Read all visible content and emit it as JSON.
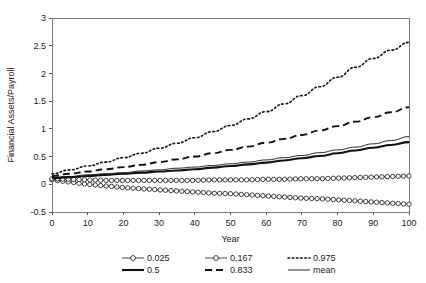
{
  "chart_data": {
    "type": "line",
    "title": "",
    "xlabel": "Year",
    "ylabel": "Financial Assets/Payroll",
    "xlim": [
      0,
      100
    ],
    "ylim": [
      -0.5,
      3
    ],
    "xticks": [
      0,
      10,
      20,
      30,
      40,
      50,
      60,
      70,
      80,
      90,
      100
    ],
    "yticks": [
      -0.5,
      0,
      0.5,
      1,
      1.5,
      2,
      2.5,
      3
    ],
    "xtick_labels": [
      "0",
      "10",
      "20",
      "30",
      "40",
      "50",
      "60",
      "70",
      "80",
      "90",
      "100"
    ],
    "ytick_labels": [
      "-0.5",
      "0",
      "0.5",
      "1",
      "1.5",
      "2",
      "2.5",
      "3"
    ],
    "grid": false,
    "legend_position": "bottom",
    "x": [
      0,
      5,
      10,
      15,
      20,
      25,
      30,
      35,
      40,
      45,
      50,
      55,
      60,
      65,
      70,
      75,
      80,
      85,
      90,
      95,
      100
    ],
    "series": [
      {
        "name": "0.025",
        "label": "0.025",
        "style": "line-open-circle-markers",
        "color": "#111111",
        "values": [
          0.08,
          0.04,
          0.0,
          -0.03,
          -0.06,
          -0.08,
          -0.1,
          -0.12,
          -0.14,
          -0.16,
          -0.17,
          -0.19,
          -0.21,
          -0.23,
          -0.25,
          -0.26,
          -0.28,
          -0.3,
          -0.32,
          -0.34,
          -0.36
        ]
      },
      {
        "name": "0.167",
        "label": "0.167",
        "style": "line-open-circle-markers",
        "color": "#111111",
        "values": [
          0.1,
          0.09,
          0.08,
          0.07,
          0.07,
          0.07,
          0.07,
          0.07,
          0.07,
          0.08,
          0.08,
          0.08,
          0.09,
          0.09,
          0.1,
          0.1,
          0.11,
          0.12,
          0.13,
          0.14,
          0.15
        ]
      },
      {
        "name": "0.975",
        "label": "0.975",
        "style": "dotted",
        "color": "#111111",
        "values": [
          0.19,
          0.26,
          0.33,
          0.4,
          0.48,
          0.56,
          0.65,
          0.74,
          0.84,
          0.95,
          1.06,
          1.18,
          1.31,
          1.45,
          1.6,
          1.76,
          1.93,
          2.11,
          2.27,
          2.42,
          2.56
        ]
      },
      {
        "name": "0.5",
        "label": "0.5",
        "style": "solid-thick",
        "color": "#111111",
        "values": [
          0.11,
          0.13,
          0.15,
          0.17,
          0.19,
          0.21,
          0.23,
          0.25,
          0.27,
          0.3,
          0.33,
          0.36,
          0.39,
          0.43,
          0.47,
          0.51,
          0.56,
          0.61,
          0.66,
          0.71,
          0.76
        ]
      },
      {
        "name": "0.833",
        "label": "0.833",
        "style": "dashed",
        "color": "#111111",
        "values": [
          0.15,
          0.19,
          0.23,
          0.27,
          0.31,
          0.35,
          0.4,
          0.45,
          0.5,
          0.56,
          0.62,
          0.68,
          0.75,
          0.82,
          0.89,
          0.97,
          1.05,
          1.13,
          1.21,
          1.3,
          1.39
        ]
      },
      {
        "name": "mean",
        "label": "mean",
        "style": "solid-thin",
        "color": "#111111",
        "values": [
          0.12,
          0.14,
          0.17,
          0.19,
          0.21,
          0.24,
          0.26,
          0.29,
          0.31,
          0.34,
          0.37,
          0.4,
          0.44,
          0.48,
          0.52,
          0.57,
          0.62,
          0.67,
          0.73,
          0.79,
          0.86
        ]
      }
    ]
  },
  "legend": {
    "entries": [
      {
        "label": "0.025",
        "style": "line-open-circle-markers"
      },
      {
        "label": "0.167",
        "style": "line-open-circle-markers"
      },
      {
        "label": "0.975",
        "style": "dotted"
      },
      {
        "label": "0.5",
        "style": "solid-thick"
      },
      {
        "label": "0.833",
        "style": "dashed"
      },
      {
        "label": "mean",
        "style": "solid-thin"
      }
    ]
  }
}
